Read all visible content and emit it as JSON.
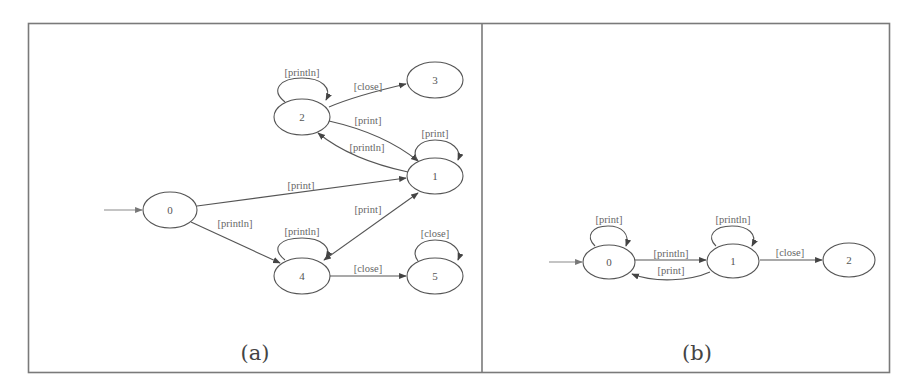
{
  "figure": {
    "panels": [
      {
        "caption": "(a)",
        "start_state": "0",
        "nodes": [
          {
            "id": "0",
            "label": "0"
          },
          {
            "id": "1",
            "label": "1"
          },
          {
            "id": "2",
            "label": "2"
          },
          {
            "id": "3",
            "label": "3"
          },
          {
            "id": "4",
            "label": "4"
          },
          {
            "id": "5",
            "label": "5"
          }
        ],
        "edges": [
          {
            "from": "0",
            "to": "1",
            "label": "[print]"
          },
          {
            "from": "0",
            "to": "4",
            "label": "[println]"
          },
          {
            "from": "2",
            "to": "2",
            "label": "[println]"
          },
          {
            "from": "2",
            "to": "3",
            "label": "[close]"
          },
          {
            "from": "2",
            "to": "1",
            "label": "[print]"
          },
          {
            "from": "1",
            "to": "2",
            "label": "[println]"
          },
          {
            "from": "1",
            "to": "1",
            "label": "[print]"
          },
          {
            "from": "4",
            "to": "1",
            "label": "[print]"
          },
          {
            "from": "4",
            "to": "4",
            "label": "[println]"
          },
          {
            "from": "4",
            "to": "5",
            "label": "[close]"
          },
          {
            "from": "5",
            "to": "5",
            "label": "[close]"
          }
        ]
      },
      {
        "caption": "(b)",
        "start_state": "0",
        "nodes": [
          {
            "id": "0",
            "label": "0"
          },
          {
            "id": "1",
            "label": "1"
          },
          {
            "id": "2",
            "label": "2"
          }
        ],
        "edges": [
          {
            "from": "0",
            "to": "0",
            "label": "[print]"
          },
          {
            "from": "0",
            "to": "1",
            "label": "[println]"
          },
          {
            "from": "1",
            "to": "0",
            "label": "[print]"
          },
          {
            "from": "1",
            "to": "1",
            "label": "[println]"
          },
          {
            "from": "1",
            "to": "2",
            "label": "[close]"
          }
        ]
      }
    ]
  }
}
